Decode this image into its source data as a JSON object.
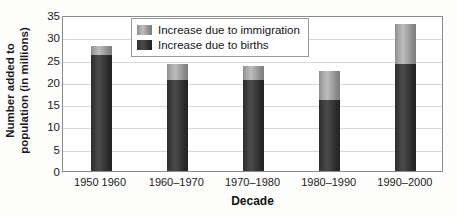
{
  "chart_data": {
    "type": "bar",
    "stacked": true,
    "title": "",
    "xlabel": "Decade",
    "ylabel": "Number added to population (in millions)",
    "ylabel_line1": "Number added to",
    "ylabel_line2": "population (in millions)",
    "categories": [
      "1950 1960",
      "1960–1970",
      "1970–1980",
      "1980–1990",
      "1990–2000"
    ],
    "series": [
      {
        "name": "Increase due to births",
        "color": "#3a3a3a",
        "values": [
          26.0,
          20.5,
          20.5,
          16.0,
          24.0
        ]
      },
      {
        "name": "Increase due to immigration",
        "color": "#b0b0b0",
        "values": [
          2.0,
          3.5,
          3.0,
          6.5,
          9.0
        ]
      }
    ],
    "totals": [
      28.0,
      24.0,
      23.5,
      22.5,
      33.0
    ],
    "ylim": [
      0,
      35
    ],
    "yticks": [
      35,
      30,
      25,
      20,
      15,
      10,
      5,
      0
    ],
    "grid": true,
    "legend_position": "top-center"
  },
  "legend": {
    "items": [
      {
        "label": "Increase due to immigration",
        "swatch": "immigration"
      },
      {
        "label": "Increase due to births",
        "swatch": "births"
      }
    ]
  }
}
